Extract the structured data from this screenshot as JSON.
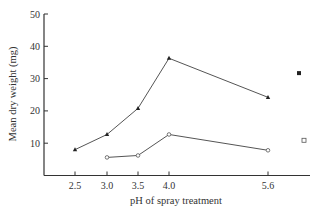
{
  "chart_data": {
    "type": "line",
    "title": "",
    "xlabel": "pH of spray treatment",
    "ylabel": "Mean dry weight (mg)",
    "ylim": [
      0,
      50
    ],
    "yticks": [
      10,
      20,
      30,
      40,
      50
    ],
    "x": [
      2.5,
      3.0,
      3.5,
      4.0,
      5.6
    ],
    "xtick_labels": [
      "2.5",
      "3.0",
      "3.5",
      "4.0",
      "5.6"
    ],
    "grid": false,
    "legend": "none",
    "series": [
      {
        "name": "filled-triangle series",
        "marker": "filled-triangle",
        "x": [
          2.5,
          3.0,
          3.5,
          4.0,
          5.6
        ],
        "values": [
          8,
          12.7,
          20.8,
          36.3,
          24.2
        ]
      },
      {
        "name": "open-circle series",
        "marker": "open-circle",
        "x": [
          3.0,
          3.5,
          4.0,
          5.6
        ],
        "values": [
          5.6,
          6.2,
          12.7,
          7.8
        ]
      }
    ],
    "annotations": [
      {
        "marker": "filled-square",
        "position": "right of 5.6",
        "value": 31.7
      },
      {
        "marker": "open-square",
        "position": "right of 5.6",
        "value": 10.9
      }
    ]
  },
  "layout": {
    "axis_color": "#333333",
    "line_color": "#555555",
    "marker_color": "#222222"
  }
}
